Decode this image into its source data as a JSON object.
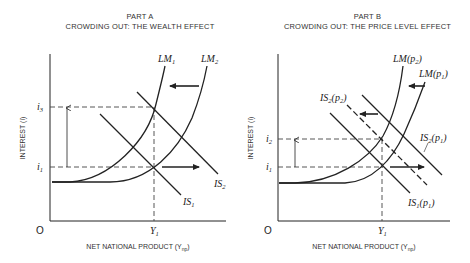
{
  "panel_a": {
    "part": "PART A",
    "title": "CROWDING OUT: THE WEALTH EFFECT",
    "y_axis_label": "INTEREST (i)",
    "x_axis_label": "NET NATIONAL PRODUCT (Y",
    "x_axis_sub": "np",
    "origin": "O",
    "y_ticks": [
      {
        "label": "i",
        "sub": "3"
      },
      {
        "label": "i",
        "sub": "1"
      }
    ],
    "x_tick": {
      "label": "Y",
      "sub": "1"
    },
    "curves": {
      "lm1": {
        "label": "LM",
        "sub": "1"
      },
      "lm2": {
        "label": "LM",
        "sub": "2"
      },
      "is1": {
        "label": "IS",
        "sub": "1"
      },
      "is2": {
        "label": "IS",
        "sub": "2"
      }
    }
  },
  "panel_b": {
    "part": "PART B",
    "title": "CROWDING OUT: THE PRICE LEVEL EFFECT",
    "y_axis_label": "INTEREST (i)",
    "x_axis_label": "NET NATIONAL PRODUCT (Y",
    "x_axis_sub": "np",
    "origin": "O",
    "y_ticks": [
      {
        "label": "i",
        "sub": "2"
      },
      {
        "label": "i",
        "sub": "1"
      }
    ],
    "x_tick": {
      "label": "Y",
      "sub": "1"
    },
    "curves": {
      "lm_p2": {
        "label": "LM(p",
        "sub": "2",
        "close": ")"
      },
      "lm_p1": {
        "label": "LM(p",
        "sub": "1",
        "close": ")"
      },
      "is2_p2": {
        "label": "IS",
        "sub": "2",
        "mid": "(p",
        "sub2": "2",
        "close": ")"
      },
      "is2_p1": {
        "label": "IS",
        "sub": "2",
        "mid": "(p",
        "sub2": "1",
        "close": ")"
      },
      "is1_p1": {
        "label": "IS",
        "sub": "1",
        "mid": "(p",
        "sub2": "1",
        "close": ")"
      }
    }
  },
  "colors": {
    "line": "#222222",
    "dashed": "#444444",
    "text": "#333333",
    "background": "#ffffff"
  }
}
